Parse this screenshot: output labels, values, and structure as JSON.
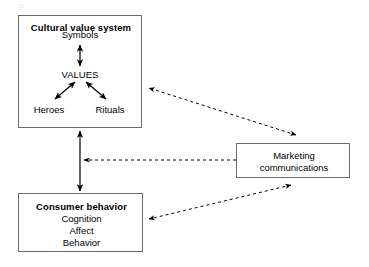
{
  "figure": {
    "background_color": "#ffffff",
    "line_color": "#000000",
    "box_border_color": "#6b6b6b",
    "artifact_mark": "µ"
  },
  "nodes": {
    "cultural_value_system": {
      "title": "Cultural value system",
      "items": {
        "symbols": "Symbols",
        "values": "VALUES",
        "heroes": "Heroes",
        "rituals": "Rituals"
      }
    },
    "consumer_behavior": {
      "title": "Consumer behavior",
      "items": [
        "Cognition",
        "Affect",
        "Behavior"
      ]
    },
    "marketing_communications": {
      "lines": [
        "Marketing",
        "communications"
      ]
    }
  },
  "connections": [
    {
      "id": "symbols-values",
      "from": "Symbols",
      "to": "VALUES",
      "style": "solid",
      "arrows": "both"
    },
    {
      "id": "values-heroes",
      "from": "VALUES",
      "to": "Heroes",
      "style": "solid",
      "arrows": "both"
    },
    {
      "id": "values-rituals",
      "from": "VALUES",
      "to": "Rituals",
      "style": "solid",
      "arrows": "both"
    },
    {
      "id": "cultural-consumer",
      "from": "Cultural value system",
      "to": "Consumer behavior",
      "style": "solid",
      "arrows": "both"
    },
    {
      "id": "cultural-marketing",
      "from": "Cultural value system",
      "to": "Marketing communications",
      "style": "dashed",
      "arrows": "both"
    },
    {
      "id": "marketing-cultural-consumer-link",
      "from": "Marketing communications",
      "to": "Cultural value system / Consumer behavior link",
      "style": "dashed",
      "arrows": "left"
    },
    {
      "id": "consumer-marketing",
      "from": "Consumer behavior",
      "to": "Marketing communications",
      "style": "dashed",
      "arrows": "both"
    }
  ]
}
